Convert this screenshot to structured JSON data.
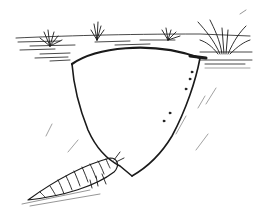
{
  "illustration": {
    "subject": "Pen-and-ink sketch of a larva beside an underground cavity beneath a grassy soil surface",
    "colors": {
      "background": "#ffffff",
      "ink": "#1a1a1a",
      "light_ink": "#8a8a8a"
    },
    "elements": [
      "soil-surface",
      "grass-tuft-left",
      "grass-tuft-center-left",
      "grass-tuft-center-right",
      "grass-tuft-right",
      "cavity-outline",
      "larva",
      "background-hatching"
    ]
  }
}
